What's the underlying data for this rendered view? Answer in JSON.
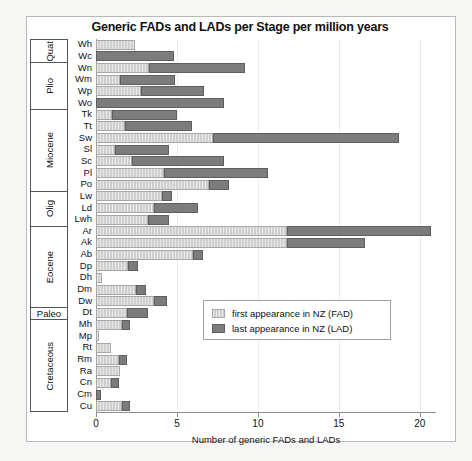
{
  "chart_data": {
    "type": "bar",
    "orientation": "horizontal",
    "stacked": true,
    "title": "Generic FADs and LADs per Stage per million years",
    "xlabel": "Number of generic FADs and LADs",
    "ylabel": "",
    "xlim": [
      0,
      21
    ],
    "xticks": [
      0,
      5,
      10,
      15,
      20
    ],
    "xtick_labels": [
      "0",
      "5",
      "10",
      "15",
      "20"
    ],
    "grid": false,
    "legend_position": "center-right-inside",
    "series": [
      {
        "name": "first appearance in NZ (FAD)",
        "color": "#cfcfcf"
      },
      {
        "name": "last appearance in NZ (LAD)",
        "color": "#7c7c7c"
      }
    ],
    "categories": [
      "Wh",
      "Wc",
      "Wn",
      "Wm",
      "Wp",
      "Wo",
      "Tk",
      "Tt",
      "Sw",
      "Sl",
      "Sc",
      "Pl",
      "Po",
      "Lw",
      "Ld",
      "Lwh",
      "Ar",
      "Ak",
      "Ab",
      "Dp",
      "Dh",
      "Dm",
      "Dw",
      "Dt",
      "Mh",
      "Mp",
      "Rt",
      "Rm",
      "Ra",
      "Cn",
      "Cm",
      "Cu"
    ],
    "fad_values": [
      2.4,
      0.0,
      3.3,
      1.5,
      2.8,
      0.0,
      1.0,
      1.8,
      7.2,
      1.2,
      2.2,
      4.2,
      7.0,
      4.1,
      3.6,
      3.2,
      11.8,
      11.8,
      6.0,
      2.0,
      0.4,
      2.5,
      3.6,
      1.9,
      1.6,
      0.2,
      0.9,
      1.4,
      1.5,
      0.9,
      0.0,
      1.6
    ],
    "lad_values": [
      0.0,
      4.8,
      5.9,
      3.4,
      3.9,
      7.9,
      4.0,
      4.1,
      11.5,
      3.3,
      5.7,
      6.4,
      1.2,
      0.6,
      2.7,
      1.3,
      8.9,
      4.8,
      0.6,
      0.6,
      0.0,
      0.6,
      0.8,
      1.3,
      0.5,
      0.0,
      0.0,
      0.5,
      0.0,
      0.5,
      0.3,
      0.5
    ],
    "epochs": [
      {
        "label": "Quat",
        "stages": [
          "Wh",
          "Wc"
        ],
        "rotated": true
      },
      {
        "label": "Plio",
        "stages": [
          "Wn",
          "Wm",
          "Wp",
          "Wo"
        ],
        "rotated": true
      },
      {
        "label": "Miocene",
        "stages": [
          "Tk",
          "Tt",
          "Sw",
          "Sl",
          "Sc",
          "Pl",
          "Po"
        ],
        "rotated": true
      },
      {
        "label": "Olig",
        "stages": [
          "Lw",
          "Ld",
          "Lwh"
        ],
        "rotated": true
      },
      {
        "label": "Eocene",
        "stages": [
          "Ar",
          "Ak",
          "Ab",
          "Dp",
          "Dh",
          "Dm",
          "Dw"
        ],
        "rotated": true
      },
      {
        "label": "Paleo",
        "stages": [
          "Dt"
        ],
        "rotated": false
      },
      {
        "label": "Cretaceous",
        "stages": [
          "Mh",
          "Mp",
          "Rt",
          "Rm",
          "Ra",
          "Cn",
          "Cm",
          "Cu"
        ],
        "rotated": true
      }
    ]
  },
  "legend": {
    "fad_label": "first appearance in NZ (FAD)",
    "lad_label": "last appearance in NZ (LAD)"
  }
}
